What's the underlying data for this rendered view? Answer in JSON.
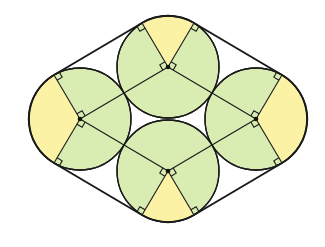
{
  "diagram": {
    "title": "",
    "circle_radius": 51,
    "centers": {
      "top": [
        168,
        67
      ],
      "left": [
        80,
        119
      ],
      "right": [
        256,
        119
      ],
      "bottom": [
        168,
        171
      ]
    },
    "colors": {
      "background": "#ffffff",
      "circle_fill": "#d9ecb2",
      "sector_fill": "#fcf2a6",
      "stroke": "#1a1a1a"
    },
    "right_angle_marks": 16,
    "labels": []
  }
}
